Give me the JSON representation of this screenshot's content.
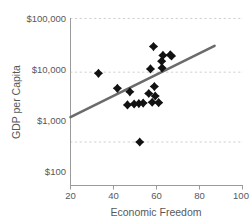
{
  "chart_data": {
    "type": "scatter",
    "title": "",
    "xlabel": "Economic Freedom",
    "ylabel": "GDP per Capita",
    "xlim": [
      20,
      100
    ],
    "ylim": [
      100,
      100000
    ],
    "yscale": "log",
    "xticks": [
      20,
      40,
      60,
      80,
      100
    ],
    "xtick_labels": [
      "20",
      "40",
      "60",
      "80",
      "100"
    ],
    "yticks": [
      100,
      1000,
      10000,
      100000
    ],
    "ytick_labels": [
      "$100",
      "$1,000",
      "$10,000",
      "$100,000"
    ],
    "grid": "horizontal-dashed",
    "gridlines_y": [
      100000,
      10000,
      500
    ],
    "legend": "none",
    "marker_shape": "diamond",
    "marker_color": "#121212",
    "trendline_color": "#6b6b6d",
    "points": [
      {
        "x": 33.0,
        "y": 9500
      },
      {
        "x": 41.8,
        "y": 5000
      },
      {
        "x": 46.5,
        "y": 2450
      },
      {
        "x": 47.6,
        "y": 4300
      },
      {
        "x": 49.6,
        "y": 2550
      },
      {
        "x": 51.8,
        "y": 2600
      },
      {
        "x": 52.2,
        "y": 500
      },
      {
        "x": 53.8,
        "y": 2650
      },
      {
        "x": 56.4,
        "y": 4000
      },
      {
        "x": 57.2,
        "y": 11500
      },
      {
        "x": 58.0,
        "y": 2750
      },
      {
        "x": 58.6,
        "y": 30000
      },
      {
        "x": 59.0,
        "y": 5400
      },
      {
        "x": 59.4,
        "y": 3600
      },
      {
        "x": 61.0,
        "y": 2700
      },
      {
        "x": 62.4,
        "y": 16000
      },
      {
        "x": 62.6,
        "y": 12000
      },
      {
        "x": 63.0,
        "y": 20500
      },
      {
        "x": 66.4,
        "y": 21000
      },
      {
        "x": 67.0,
        "y": 20000
      }
    ],
    "trendline": {
      "x_start": 20.0,
      "y_start": 1450,
      "x_end": 87.0,
      "y_end": 31000
    }
  }
}
